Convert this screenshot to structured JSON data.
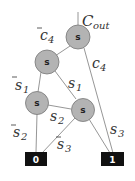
{
  "diagram": {
    "type": "binary-decision-diagram",
    "output_label": {
      "main": "C",
      "sub": "out"
    },
    "nodes": [
      {
        "id": "n1",
        "label": "s"
      },
      {
        "id": "n2",
        "label": "s"
      },
      {
        "id": "n3",
        "label": "s"
      },
      {
        "id": "n4",
        "label": "s"
      }
    ],
    "terminals": [
      {
        "id": "t0",
        "label": "0"
      },
      {
        "id": "t1",
        "label": "1"
      }
    ],
    "edges": [
      {
        "from": "n1",
        "to": "n2",
        "label": "c",
        "sub": "4",
        "negated": true
      },
      {
        "from": "n1",
        "to": "t1",
        "label": "c",
        "sub": "4",
        "negated": false
      },
      {
        "from": "n2",
        "to": "n3",
        "label": "s",
        "sub": "1",
        "negated": true
      },
      {
        "from": "n2",
        "to": "n4",
        "label": "s",
        "sub": "1",
        "negated": false
      },
      {
        "from": "n3",
        "to": "t0",
        "label": "s",
        "sub": "2",
        "negated": true
      },
      {
        "from": "n3",
        "to": "n4",
        "label": "s",
        "sub": "2",
        "negated": false
      },
      {
        "from": "n4",
        "to": "t0",
        "label": "s",
        "sub": "3",
        "negated": true
      },
      {
        "from": "n4",
        "to": "t1",
        "label": "s",
        "sub": "3",
        "negated": false
      }
    ],
    "colors": {
      "node_fill": "#b3b3b3",
      "node_stroke": "#777777",
      "terminal_fill": "#111111",
      "edge": "#888888"
    }
  }
}
